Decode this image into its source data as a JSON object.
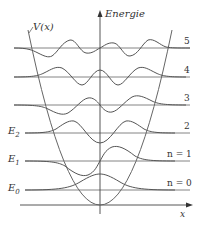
{
  "diagram": {
    "axis_y_label": "Energie",
    "axis_x_label": "x",
    "potential_label": "V(x)",
    "energy_labels": [
      "E0",
      "E1",
      "E2"
    ],
    "level_labels": [
      "n = 0",
      "n = 1",
      "2",
      "3",
      "4",
      "5"
    ],
    "colors": {
      "line": "#555555",
      "text": "#333333",
      "background": "#ffffff"
    }
  },
  "labels": {
    "energie": "Energie",
    "x": "x",
    "V": "V",
    "Vx_paren": "(x)",
    "E": "E",
    "sub0": "0",
    "sub1": "1",
    "sub2": "2",
    "n0": "n = 0",
    "n1": "n = 1",
    "n2": "2",
    "n3": "3",
    "n4": "4",
    "n5": "5"
  }
}
